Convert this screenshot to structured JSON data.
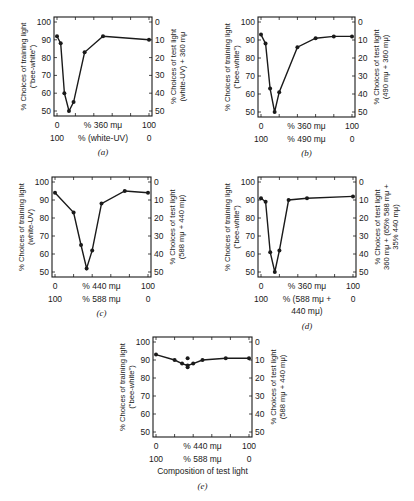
{
  "chart_data": [
    {
      "id": "a",
      "type": "line",
      "panel_label": "(a)",
      "ylabel_left": [
        "% Choices of training light",
        "(\"bee-white\")"
      ],
      "ylabel_right": [
        "% Choices of test light",
        "(white-UV) + 360 mμ"
      ],
      "xlabel_top_ticks": [
        "0",
        "% 360 mμ",
        "100"
      ],
      "xlabel_bottom_ticks": [
        "100",
        "% (white-UV)",
        "0"
      ],
      "xlabel_extra": "",
      "ylim": [
        50,
        100
      ],
      "ylim_right": [
        50,
        0
      ],
      "yticks_left": [
        100,
        90,
        80,
        70,
        60,
        50
      ],
      "yticks_right": [
        0,
        10,
        20,
        30,
        40,
        50
      ],
      "x": [
        0,
        4,
        8,
        13,
        18,
        30,
        50,
        100
      ],
      "values": [
        92,
        88,
        60,
        50,
        55,
        83,
        92,
        90
      ]
    },
    {
      "id": "b",
      "type": "line",
      "panel_label": "(b)",
      "ylabel_left": [
        "% Choices of training light",
        "(\"bee-white\")"
      ],
      "ylabel_right": [
        "% Choices of test light",
        "(490 mμ + 360 mμ)"
      ],
      "xlabel_top_ticks": [
        "0",
        "% 360 mμ",
        "100"
      ],
      "xlabel_bottom_ticks": [
        "100",
        "% 490 mμ",
        "0"
      ],
      "xlabel_extra": "",
      "ylim": [
        50,
        100
      ],
      "ylim_right": [
        50,
        0
      ],
      "yticks_left": [
        100,
        90,
        80,
        70,
        60,
        50
      ],
      "yticks_right": [
        0,
        10,
        20,
        30,
        40,
        50
      ],
      "x": [
        0,
        5,
        10,
        15,
        20,
        40,
        60,
        80,
        100
      ],
      "values": [
        93,
        88,
        63,
        50,
        61,
        86,
        91,
        92,
        92
      ]
    },
    {
      "id": "c",
      "type": "line",
      "panel_label": "(c)",
      "ylabel_left": [
        "% Choices of training light",
        "(white-UV)"
      ],
      "ylabel_right": [
        "% Choices of test light",
        "(588 mμ + 440 mμ)"
      ],
      "xlabel_top_ticks": [
        "0",
        "% 440 mμ",
        "100"
      ],
      "xlabel_bottom_ticks": [
        "100",
        "% 588 mμ",
        "0"
      ],
      "xlabel_extra": "",
      "ylim": [
        50,
        100
      ],
      "ylim_right": [
        50,
        0
      ],
      "yticks_left": [
        100,
        90,
        80,
        70,
        60,
        50
      ],
      "yticks_right": [
        0,
        10,
        20,
        30,
        40,
        50
      ],
      "x": [
        0,
        20,
        28,
        34,
        40,
        50,
        75,
        100
      ],
      "values": [
        94,
        83,
        65,
        52,
        62,
        88,
        95,
        94
      ]
    },
    {
      "id": "d",
      "type": "line",
      "panel_label": "(d)",
      "ylabel_left": [
        "% Choices of training light",
        "(\"bee-white\")"
      ],
      "ylabel_right": [
        "% Choices of test light",
        "360 mμ + (65% 588 mμ +",
        "35% 440 mμ)"
      ],
      "xlabel_top_ticks": [
        "0",
        "% 360 mμ",
        "100"
      ],
      "xlabel_bottom_ticks": [
        "100",
        "% (588 mμ +",
        "0"
      ],
      "xlabel_extra": "440 mμ)",
      "ylim": [
        50,
        100
      ],
      "ylim_right": [
        50,
        0
      ],
      "yticks_left": [
        100,
        90,
        80,
        70,
        60,
        50
      ],
      "yticks_right": [
        0,
        10,
        20,
        30,
        40,
        50
      ],
      "x": [
        0,
        5,
        10,
        15,
        20,
        30,
        50,
        100
      ],
      "values": [
        91,
        89,
        61,
        50,
        62,
        90,
        91,
        92
      ]
    },
    {
      "id": "e",
      "type": "line",
      "panel_label": "(e)",
      "ylabel_left": [
        "% Choices of training light",
        "(\"bee-white\")"
      ],
      "ylabel_right": [
        "% Choices of test light",
        "(588 mμ + 440 mμ)"
      ],
      "xlabel_top_ticks": [
        "0",
        "% 440 mμ",
        "100"
      ],
      "xlabel_bottom_ticks": [
        "100",
        "% 588 mμ",
        "0"
      ],
      "xlabel_extra": "Composition of test light",
      "ylim": [
        50,
        100
      ],
      "ylim_right": [
        50,
        0
      ],
      "yticks_left": [
        100,
        90,
        80,
        70,
        60,
        50
      ],
      "yticks_right": [
        0,
        10,
        20,
        30,
        40,
        50
      ],
      "x": [
        0,
        20,
        28,
        34,
        40,
        50,
        75,
        100
      ],
      "values": [
        93,
        90,
        88,
        87,
        88,
        90,
        91,
        91
      ],
      "extra_points": [
        {
          "x": 34,
          "y": 91
        },
        {
          "x": 34,
          "y": 86
        }
      ]
    }
  ],
  "panels_layout": {
    "a": {
      "left": 54,
      "top": 17,
      "width": 98,
      "height": 99
    },
    "b": {
      "left": 258,
      "top": 17,
      "width": 97,
      "height": 100
    },
    "c": {
      "left": 52,
      "top": 177,
      "width": 99,
      "height": 100
    },
    "d": {
      "left": 258,
      "top": 177,
      "width": 98,
      "height": 100
    },
    "e": {
      "left": 153,
      "top": 337,
      "width": 99,
      "height": 100
    }
  },
  "colors": {
    "ink": "#1a1a1a",
    "background": "#ffffff"
  }
}
